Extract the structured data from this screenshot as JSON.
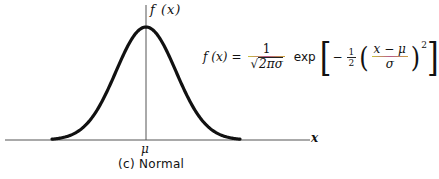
{
  "figure": {
    "y_axis_label": "f (x)",
    "x_axis_label": "x",
    "mean_label": "μ",
    "caption": "(c) Normal",
    "formula": {
      "lhs": "f (x)",
      "equals": "=",
      "coef_numerator": "1",
      "coef_denominator_sqrt": "2πσ",
      "exp_word": "exp",
      "inner_sign": "−",
      "half_numerator": "1",
      "half_denominator": "2",
      "z_numerator": "x − μ",
      "z_denominator": "σ",
      "exponent": "2"
    }
  },
  "chart_data": {
    "type": "line",
    "title": "(c) Normal",
    "xlabel": "x",
    "ylabel": "f(x)",
    "curve": "normal probability density (bell curve) centered at μ",
    "x_ticks": [
      "μ"
    ],
    "y_ticks": [],
    "grid": false,
    "legend": null,
    "annotations": [
      "f(x) = 1/(√(2π)σ) exp[−½((x−μ)/σ)²]"
    ]
  },
  "colors": {
    "curve": "#111111",
    "axis": "#444444",
    "fraction_bar_accent": "#b85a8a"
  }
}
